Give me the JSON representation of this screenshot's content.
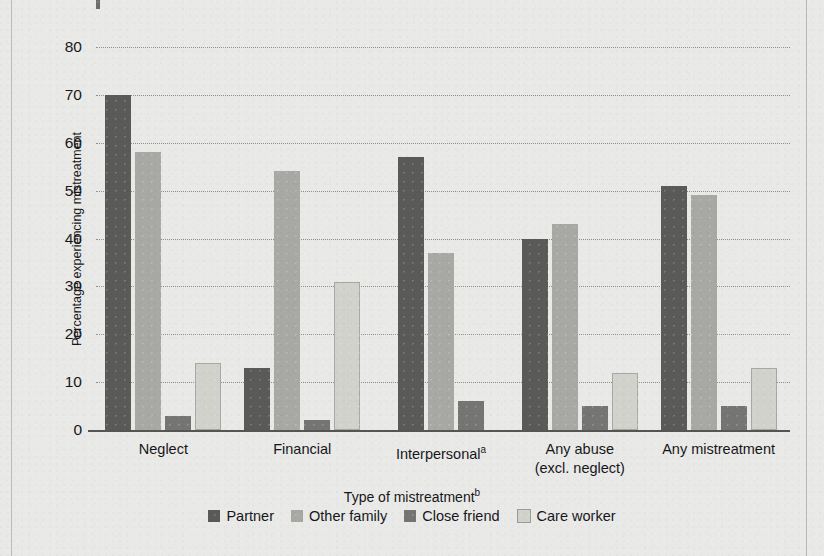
{
  "chart_data": {
    "type": "bar",
    "title": "",
    "xlabel": "Type of mistreatment",
    "xlabel_superscript": "b",
    "ylabel": "Percentage experiencing mistreatment",
    "ylim": [
      0,
      80
    ],
    "ytick_step": 10,
    "yticks": [
      0,
      10,
      20,
      30,
      40,
      50,
      60,
      70,
      80
    ],
    "grid": "horizontal-dotted",
    "legend_position": "bottom-center",
    "categories": [
      "Neglect",
      "Financial",
      "Interpersonal",
      "Any abuse\n(excl. neglect)",
      "Any mistreatment"
    ],
    "category_labels": [
      {
        "line1": "Neglect",
        "line2": "",
        "superscript": ""
      },
      {
        "line1": "Financial",
        "line2": "",
        "superscript": ""
      },
      {
        "line1": "Interpersonal",
        "line2": "",
        "superscript": "a"
      },
      {
        "line1": "Any abuse",
        "line2": "(excl. neglect)",
        "superscript": ""
      },
      {
        "line1": "Any mistreatment",
        "line2": "",
        "superscript": ""
      }
    ],
    "series": [
      {
        "name": "Partner",
        "color": "#5a5a58",
        "values": [
          70,
          13,
          57,
          40,
          51
        ]
      },
      {
        "name": "Other family",
        "color": "#a8a8a4",
        "values": [
          58,
          54,
          37,
          43,
          49
        ]
      },
      {
        "name": "Close friend",
        "color": "#757573",
        "values": [
          3,
          2,
          6,
          5,
          5
        ]
      },
      {
        "name": "Care worker",
        "color": "#d2d2cd",
        "values": [
          14,
          31,
          null,
          12,
          13
        ]
      }
    ]
  },
  "legend": {
    "items": [
      {
        "label": "Partner",
        "color": "#5a5a58"
      },
      {
        "label": "Other family",
        "color": "#a8a8a4"
      },
      {
        "label": "Close friend",
        "color": "#757573"
      },
      {
        "label": "Care worker",
        "color": "#d2d2cd"
      }
    ]
  },
  "axis": {
    "y_tick_0": "0",
    "y_tick_10": "10",
    "y_tick_20": "20",
    "y_tick_30": "30",
    "y_tick_40": "40",
    "y_tick_50": "50",
    "y_tick_60": "60",
    "y_tick_70": "70",
    "y_tick_80": "80"
  }
}
